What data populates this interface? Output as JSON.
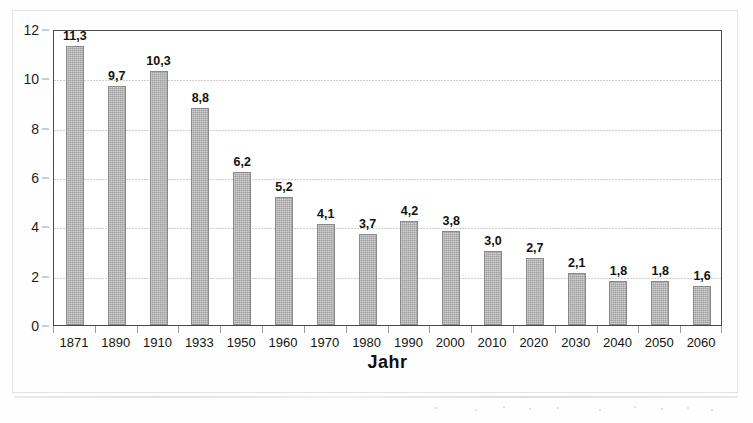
{
  "chart_data": {
    "type": "bar",
    "title": "",
    "xlabel": "Jahr",
    "ylabel": "",
    "categories": [
      "1871",
      "1890",
      "1910",
      "1933",
      "1950",
      "1960",
      "1970",
      "1980",
      "1990",
      "2000",
      "2010",
      "2020",
      "2030",
      "2040",
      "2050",
      "2060"
    ],
    "values": [
      11.3,
      9.7,
      10.3,
      8.8,
      6.2,
      5.2,
      4.1,
      3.7,
      4.2,
      3.8,
      3.0,
      2.7,
      2.1,
      1.8,
      1.8,
      1.6
    ],
    "data_labels": [
      "11,3",
      "9,7",
      "10,3",
      "8,8",
      "6,2",
      "5,2",
      "4,1",
      "3,7",
      "4,2",
      "3,8",
      "3,0",
      "2,7",
      "2,1",
      "1,8",
      "1,8",
      "1,6"
    ],
    "ylim": [
      0,
      12
    ],
    "yticks": [
      0,
      2,
      4,
      6,
      8,
      10,
      12
    ],
    "ytick_labels": [
      "0",
      "2",
      "4",
      "6",
      "8",
      "10",
      "12"
    ],
    "grid": true,
    "grid_axis": "y",
    "legend": false,
    "decimal_separator": ",",
    "bar_color": "#9d9d9d",
    "bar_edge_color": "#8a8a8a",
    "plot_border_color": "#4a4a4a",
    "gridline_color": "#c9c9c9",
    "text_color": "#121212",
    "background_color": "#ffffff"
  }
}
